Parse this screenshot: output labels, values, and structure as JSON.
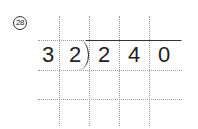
{
  "problem": {
    "number": "28",
    "divisor": [
      "3",
      "2"
    ],
    "dividend": [
      "2",
      "4",
      "0"
    ],
    "quotient": []
  }
}
